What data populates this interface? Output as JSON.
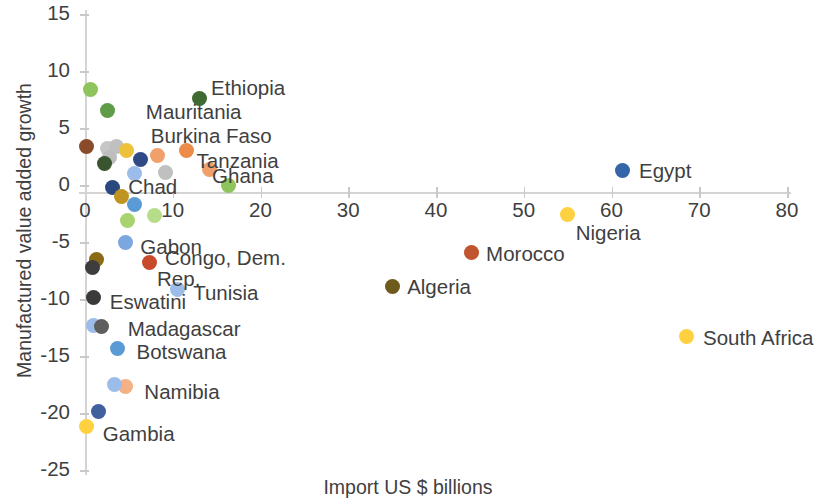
{
  "chart_data": {
    "type": "scatter",
    "title": "",
    "xlabel": "Import US $ billions",
    "ylabel": "Manufactured value added growth",
    "xlim": [
      0,
      80
    ],
    "ylim": [
      -25,
      15
    ],
    "xticks": [
      0,
      10,
      20,
      30,
      40,
      50,
      60,
      70,
      80
    ],
    "yticks": [
      15,
      10,
      5,
      0,
      -5,
      -10,
      -15,
      -20,
      -25
    ],
    "grid": false,
    "legend": "none",
    "labels_inline": true,
    "points": [
      {
        "name": "Ethiopia",
        "x": 13.0,
        "y": 7.6,
        "color": "#3f6b33",
        "labeled": true,
        "label_dx": 12,
        "label_dy": -21
      },
      {
        "name": "Mauritania",
        "x": 2.6,
        "y": 6.5,
        "color": "#5e9c48",
        "labeled": true,
        "label_dx": 38,
        "label_dy": -10
      },
      {
        "name": "Burkina Faso",
        "x": 11.6,
        "y": 3.0,
        "color": "#ed8b48",
        "labeled": true,
        "label_dx": -36,
        "label_dy": -26
      },
      {
        "name": "Tanzania",
        "x": 14.2,
        "y": 1.4,
        "color": "#f0a06a",
        "labeled": true,
        "label_dx": -13,
        "label_dy": -19
      },
      {
        "name": "Ghana",
        "x": 16.3,
        "y": 0.0,
        "color": "#8fc35c",
        "labeled": true,
        "label_dx": -16,
        "label_dy": -20
      },
      {
        "name": "Chad",
        "x": 3.1,
        "y": -0.2,
        "color": "#28487e",
        "labeled": true,
        "label_dx": 16,
        "label_dy": -11
      },
      {
        "name": "Gabon",
        "x": 4.6,
        "y": -5.0,
        "color": "#7ba7de",
        "labeled": true,
        "label_dx": 15,
        "label_dy": -6
      },
      {
        "name": "Congo, Dem. Rep.",
        "x": 7.3,
        "y": -6.8,
        "color": "#c94a2b",
        "labeled": true,
        "label_dx": 16,
        "label_dy": -16
      },
      {
        "name": "Tunisia",
        "x": 10.5,
        "y": -9.2,
        "color": "#9cbce9",
        "labeled": true,
        "label_dx": 16,
        "label_dy": -8
      },
      {
        "name": "Eswatini",
        "x": 1.0,
        "y": -9.9,
        "color": "#3a3a3a",
        "labeled": true,
        "label_dx": 16,
        "label_dy": -7
      },
      {
        "name": "Madagascar",
        "x": 1.0,
        "y": -12.3,
        "color": "#9cbce9",
        "labeled": true,
        "label_dx": 34,
        "label_dy": -7
      },
      {
        "name": "Botswana",
        "x": 3.7,
        "y": -14.3,
        "color": "#5b9bd5",
        "labeled": true,
        "label_dx": 19,
        "label_dy": -7
      },
      {
        "name": "Namibia",
        "x": 4.6,
        "y": -17.7,
        "color": "#f4b183",
        "labeled": true,
        "label_dx": 19,
        "label_dy": -6
      },
      {
        "name": "Gambia",
        "x": 0.2,
        "y": -21.2,
        "color": "#ffd040",
        "labeled": true,
        "label_dx": 16,
        "label_dy": -4
      },
      {
        "name": "Egypt",
        "x": 61.2,
        "y": 1.3,
        "color": "#3465a8",
        "labeled": true,
        "label_dx": 17,
        "label_dy": -10
      },
      {
        "name": "Morocco",
        "x": 44.0,
        "y": -5.9,
        "color": "#c0562f",
        "labeled": true,
        "label_dx": 15,
        "label_dy": -9
      },
      {
        "name": "Nigeria",
        "x": 55.0,
        "y": -2.6,
        "color": "#ffd040",
        "labeled": true,
        "label_dx": 8,
        "label_dy": 7
      },
      {
        "name": "Algeria",
        "x": 35.0,
        "y": -8.9,
        "color": "#6e5a1b",
        "labeled": true,
        "label_dx": 15,
        "label_dy": -10
      },
      {
        "name": "South Africa",
        "x": 68.6,
        "y": -13.3,
        "color": "#ffd040",
        "labeled": true,
        "label_dx": 16,
        "label_dy": -10
      },
      {
        "name": "unlabeled-1",
        "x": 0.6,
        "y": 8.4,
        "color": "#8fc35c",
        "labeled": false
      },
      {
        "name": "unlabeled-2",
        "x": 0.2,
        "y": 3.4,
        "color": "#8a4b2a",
        "labeled": false
      },
      {
        "name": "unlabeled-3",
        "x": 2.6,
        "y": 3.2,
        "color": "#c6c6c6",
        "labeled": false
      },
      {
        "name": "unlabeled-4",
        "x": 3.6,
        "y": 3.4,
        "color": "#c0c0c0",
        "labeled": false
      },
      {
        "name": "unlabeled-5",
        "x": 4.7,
        "y": 3.0,
        "color": "#edc13a",
        "labeled": false
      },
      {
        "name": "unlabeled-6",
        "x": 2.8,
        "y": 2.4,
        "color": "#bdbdbd",
        "labeled": false
      },
      {
        "name": "unlabeled-7",
        "x": 2.2,
        "y": 1.9,
        "color": "#3a5430",
        "labeled": false
      },
      {
        "name": "unlabeled-8",
        "x": 6.3,
        "y": 2.2,
        "color": "#2f4a85",
        "labeled": false
      },
      {
        "name": "unlabeled-9",
        "x": 8.3,
        "y": 2.6,
        "color": "#f0a06a",
        "labeled": false
      },
      {
        "name": "unlabeled-10",
        "x": 5.6,
        "y": 1.0,
        "color": "#9cbce9",
        "labeled": false
      },
      {
        "name": "unlabeled-11",
        "x": 9.2,
        "y": 1.1,
        "color": "#c0c0c0",
        "labeled": false
      },
      {
        "name": "unlabeled-12",
        "x": 4.2,
        "y": -1.0,
        "color": "#bf9420",
        "labeled": false
      },
      {
        "name": "unlabeled-13",
        "x": 5.6,
        "y": -1.7,
        "color": "#5b9bd5",
        "labeled": false
      },
      {
        "name": "unlabeled-14",
        "x": 4.9,
        "y": -3.1,
        "color": "#a8d470",
        "labeled": false
      },
      {
        "name": "unlabeled-15",
        "x": 7.9,
        "y": -2.7,
        "color": "#b6dd8a",
        "labeled": false
      },
      {
        "name": "unlabeled-16",
        "x": 1.3,
        "y": -6.5,
        "color": "#8a6b14",
        "labeled": false
      },
      {
        "name": "unlabeled-17",
        "x": 0.9,
        "y": -7.2,
        "color": "#3d3d3d",
        "labeled": false
      },
      {
        "name": "unlabeled-18",
        "x": 1.9,
        "y": -12.4,
        "color": "#5e5e5e",
        "labeled": false
      },
      {
        "name": "unlabeled-19",
        "x": 3.4,
        "y": -17.5,
        "color": "#9cbce9",
        "labeled": false
      },
      {
        "name": "unlabeled-20",
        "x": 1.5,
        "y": -19.9,
        "color": "#41609e",
        "labeled": false
      }
    ]
  }
}
